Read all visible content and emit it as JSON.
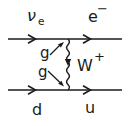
{
  "diagram": {
    "type": "feynman-diagram",
    "labels": {
      "incoming_lepton": {
        "base": "ν",
        "sub": "e"
      },
      "outgoing_lepton": {
        "base": "e",
        "sup": "−"
      },
      "boson": {
        "base": "W",
        "sup": "+"
      },
      "coupling_top": "g",
      "coupling_bottom": "g",
      "incoming_quark": "d",
      "outgoing_quark": "u"
    },
    "colors": {
      "ink": "#1b1b1b",
      "background": "#ffffff"
    }
  }
}
